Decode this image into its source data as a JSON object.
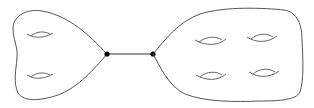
{
  "diagram": {
    "left_surface": {
      "genus": 2,
      "holes": 2
    },
    "right_surface": {
      "genus": 4,
      "holes": 4
    },
    "nodes": 2,
    "edges": 1,
    "colors": {
      "stroke": "#555555",
      "node": "#000000",
      "background": "#ffffff"
    }
  }
}
